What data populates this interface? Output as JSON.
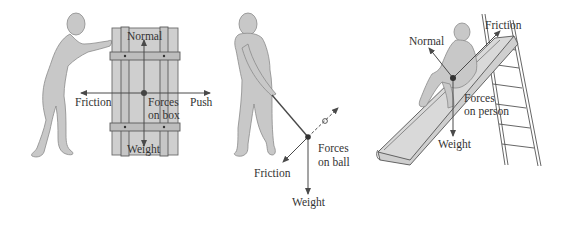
{
  "colors": {
    "figure_fill": "#c8c8c8",
    "figure_stroke": "#8a8a8a",
    "box_fill": "#cfcfcf",
    "line": "#4a4a4a",
    "text": "#333333",
    "background": "#ffffff"
  },
  "panels": [
    {
      "id": "box",
      "subject": "Forces on box",
      "forces_label_line1": "Forces",
      "forces_label_line2": "on box",
      "forces": {
        "normal": "Normal",
        "weight": "Weight",
        "friction": "Friction",
        "push": "Push"
      }
    },
    {
      "id": "ball",
      "subject": "Forces on ball",
      "forces_label_line1": "Forces",
      "forces_label_line2": "on ball",
      "forces": {
        "friction": "Friction",
        "weight": "Weight"
      }
    },
    {
      "id": "person",
      "subject": "Forces on person",
      "forces_label_line1": "Forces",
      "forces_label_line2": "on person",
      "forces": {
        "normal": "Normal",
        "friction": "Friction",
        "weight": "Weight"
      }
    }
  ]
}
